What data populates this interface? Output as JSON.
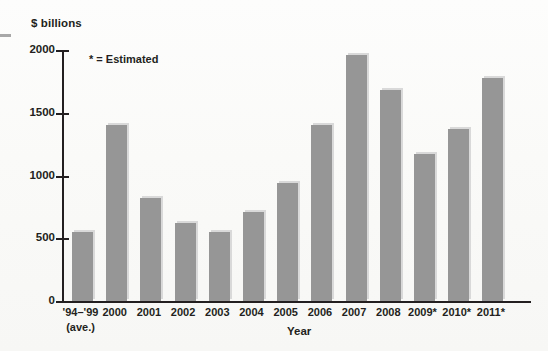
{
  "chart_data": {
    "type": "bar",
    "title": "",
    "subtitle": "",
    "xlabel": "Year",
    "ylabel": "$ billions",
    "annotation": "* = Estimated",
    "ylim": [
      0,
      2000
    ],
    "yticks": [
      0,
      500,
      1000,
      1500,
      2000
    ],
    "ytick_labels": [
      "0",
      "500",
      "1000",
      "1500",
      "2000"
    ],
    "grid": false,
    "legend": false,
    "bar_color": "#969696",
    "axis_color": "#231f20",
    "categories": [
      "'94–'99",
      "2000",
      "2001",
      "2002",
      "2003",
      "2004",
      "2005",
      "2006",
      "2007",
      "2008",
      "2009*",
      "2010*",
      "2011*"
    ],
    "category_sublabels": [
      "(ave.)",
      "",
      "",
      "",
      "",
      "",
      "",
      "",
      "",
      "",
      "",
      "",
      ""
    ],
    "values": [
      550,
      1400,
      820,
      620,
      550,
      710,
      940,
      1400,
      1960,
      1680,
      1170,
      1370,
      1780
    ]
  }
}
